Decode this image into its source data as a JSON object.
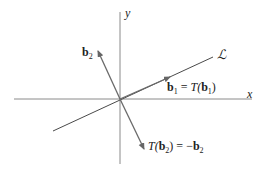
{
  "diagram": {
    "axes": {
      "x_label": "x",
      "y_label": "y"
    },
    "line_label": "ℒ",
    "vectors": {
      "b2": {
        "base": "b",
        "sub": "2"
      },
      "b1_eq": {
        "lhs_base": "b",
        "lhs_sub": "1",
        "eq": " = ",
        "fn": "T(",
        "arg_base": "b",
        "arg_sub": "1",
        "close": ")"
      },
      "tb2_eq": {
        "fn": "T(",
        "arg_base": "b",
        "arg_sub": "2",
        "close": ")",
        "eq": " = −",
        "rhs_base": "b",
        "rhs_sub": "2"
      }
    },
    "colors": {
      "axis": "#8a8a8a",
      "line": "#4a4a4a",
      "vector": "#7a7a7a"
    }
  }
}
